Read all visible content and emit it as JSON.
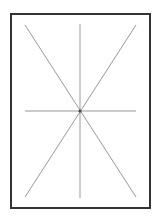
{
  "diagram": {
    "frame": {
      "x": 11,
      "y": 14,
      "width": 139,
      "height": 194,
      "stroke": "#333333",
      "stroke_width": 2
    },
    "center": {
      "x": 80,
      "y": 111,
      "color": "#444444"
    },
    "lines": [
      {
        "name": "diagonal-tl-br",
        "x1": 25,
        "y1": 25,
        "x2": 136,
        "y2": 197
      },
      {
        "name": "diagonal-tr-bl",
        "x1": 136,
        "y1": 25,
        "x2": 25,
        "y2": 197
      },
      {
        "name": "vertical",
        "x1": 80,
        "y1": 24,
        "x2": 80,
        "y2": 198
      },
      {
        "name": "horizontal",
        "x1": 25,
        "y1": 111,
        "x2": 136,
        "y2": 111
      }
    ],
    "line_color": "#999999"
  }
}
